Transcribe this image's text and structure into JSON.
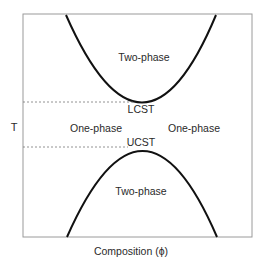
{
  "diagram": {
    "title": "",
    "y_axis_label": "T",
    "x_axis_label": "Composition (ϕ)",
    "regions": {
      "upper_two_phase": "Two-phase",
      "left_one_phase": "One-phase",
      "right_one_phase": "One-phase",
      "lower_two_phase": "Two-phase"
    },
    "critical_points": {
      "lcst": "LCST",
      "ucst": "UCST"
    },
    "colors": {
      "frame": "#999999",
      "curve": "#111111",
      "dashed": "#777777",
      "text": "#2a2a2a"
    }
  }
}
